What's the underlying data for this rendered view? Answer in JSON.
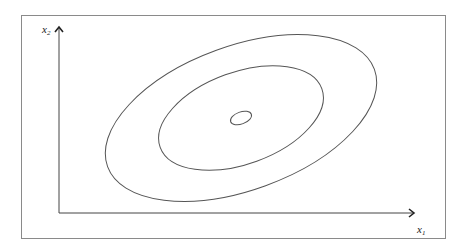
{
  "diagram": {
    "type": "contour-plot",
    "axes": {
      "x": {
        "label": "x",
        "subscript": "1"
      },
      "y": {
        "label": "x",
        "subscript": "2"
      }
    },
    "contours": [
      {
        "name": "outer-contour",
        "level": 3
      },
      {
        "name": "middle-contour",
        "level": 2
      },
      {
        "name": "inner-contour",
        "level": 1
      }
    ],
    "colors": {
      "line": "#555555",
      "axis": "#333333",
      "frame": "#8a8a8a"
    }
  }
}
